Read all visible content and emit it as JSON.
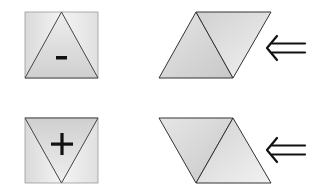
{
  "diagram": {
    "rows": [
      {
        "square": {
          "symbol": "-",
          "triangle": "pointing-up"
        },
        "parallelogram": {
          "slant": "right",
          "triangles": 2
        },
        "arrow": {
          "glyph": "double-left-arrow",
          "direction": "left"
        }
      },
      {
        "square": {
          "symbol": "+",
          "triangle": "pointing-down"
        },
        "parallelogram": {
          "slant": "left",
          "triangles": 2
        },
        "arrow": {
          "glyph": "double-left-arrow",
          "direction": "left"
        }
      }
    ]
  },
  "colors": {
    "outline": "#333333",
    "fill_light": "#f2f2f2",
    "fill_mid": "#d4d4d4",
    "fill_dark": "#c4c4c4",
    "symbol": "#111111",
    "background": "#ffffff"
  }
}
